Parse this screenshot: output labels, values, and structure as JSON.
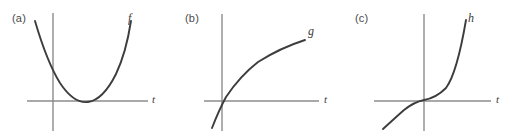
{
  "figure": {
    "width": 513,
    "height": 137,
    "background": "#ffffff",
    "axis_color": "#8c8c8c",
    "curve_color": "#3d3d3d",
    "label_color": "#4a4a4a"
  },
  "panels": [
    {
      "id": "a",
      "label": "(a)",
      "curve_label": "f",
      "axis_label": "t",
      "label_pos": {
        "x": 12,
        "y": 12
      },
      "curve_label_pos": {
        "x": 128,
        "y": 11
      },
      "axis_label_pos": {
        "x": 152,
        "y": 93
      },
      "x_axis": {
        "x1": 27,
        "y1": 101,
        "x2": 148,
        "y2": 101
      },
      "y_axis": {
        "x1": 53,
        "y1": 13,
        "x2": 53,
        "y2": 131
      },
      "curve_path": "M 35 21 Q 47 62 60 83 Q 74 104 88 102 Q 103 100 116 74 Q 126 53 131 21",
      "curve_description": "upward-opening parabola with vertex on the t-axis"
    },
    {
      "id": "b",
      "label": "(b)",
      "curve_label": "g",
      "axis_label": "t",
      "label_pos": {
        "x": 185,
        "y": 12
      },
      "curve_label_pos": {
        "x": 308,
        "y": 24
      },
      "axis_label_pos": {
        "x": 324,
        "y": 93
      },
      "x_axis": {
        "x1": 204,
        "y1": 101,
        "x2": 319,
        "y2": 101
      },
      "y_axis": {
        "x1": 222,
        "y1": 14,
        "x2": 222,
        "y2": 131
      },
      "curve_path": "M 212 128 Q 219 110 226 97 Q 240 76 258 62 Q 280 48 305 40",
      "curve_description": "increasing concave-down logarithmic-type curve crossing near the origin"
    },
    {
      "id": "c",
      "label": "(c)",
      "curve_label": "h",
      "axis_label": "t",
      "label_pos": {
        "x": 355,
        "y": 12
      },
      "curve_label_pos": {
        "x": 468,
        "y": 11
      },
      "axis_label_pos": {
        "x": 496,
        "y": 93
      },
      "x_axis": {
        "x1": 374,
        "y1": 101,
        "x2": 491,
        "y2": 101
      },
      "y_axis": {
        "x1": 424,
        "y1": 14,
        "x2": 424,
        "y2": 131
      },
      "curve_path": "M 383 129 Q 395 118 404 110 Q 414 102 424 100 Q 436 98 446 88 Q 457 73 466 20",
      "curve_description": "increasing cubic-type curve with inflection point at the origin"
    }
  ],
  "chart_data": {
    "type": "line",
    "title": "",
    "xlabel": "t",
    "ylabel": "",
    "grid": false,
    "legend": "none",
    "subplots": [
      {
        "panel": "(a)",
        "series_name": "f",
        "shape": "parabola opening upward, vertex tangent to t-axis right of origin",
        "x": [
          -1.4,
          -1.0,
          -0.5,
          0.0,
          0.5,
          1.0,
          1.5,
          2.0,
          2.5
        ],
        "y": [
          5.8,
          4.0,
          2.2,
          1.0,
          0.3,
          0.0,
          0.3,
          1.4,
          3.4
        ]
      },
      {
        "panel": "(b)",
        "series_name": "g",
        "shape": "increasing, concave down, passes through origin",
        "x": [
          -0.3,
          -0.1,
          0.0,
          0.5,
          1.0,
          1.5,
          2.0,
          2.5,
          3.0
        ],
        "y": [
          -2.0,
          -0.6,
          0.0,
          1.1,
          1.7,
          2.1,
          2.4,
          2.7,
          2.9
        ]
      },
      {
        "panel": "(c)",
        "series_name": "h",
        "shape": "increasing cubic with inflection at origin",
        "x": [
          -1.8,
          -1.4,
          -1.0,
          -0.5,
          0.0,
          0.5,
          1.0,
          1.4,
          1.8
        ],
        "y": [
          -2.6,
          -1.4,
          -0.6,
          -0.2,
          0.0,
          0.2,
          0.7,
          1.9,
          4.2
        ]
      }
    ]
  }
}
